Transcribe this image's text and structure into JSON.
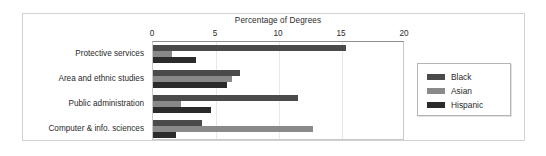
{
  "chart_data": {
    "type": "bar",
    "orientation": "horizontal",
    "title": "Percentage of Degrees",
    "xlabel": "",
    "ylabel": "",
    "xlim": [
      0,
      20
    ],
    "xticks": [
      0,
      5,
      10,
      15,
      20
    ],
    "xtick_labels": [
      "0",
      "5",
      "10",
      "15",
      "20"
    ],
    "grid": true,
    "legend_position": "right",
    "categories": [
      "Protective services",
      "Area and ethnic studies",
      "Public administration",
      "Computer & info. sciences"
    ],
    "series": [
      {
        "name": "Black",
        "color": "#4a4a4a",
        "values": [
          15.3,
          6.9,
          11.5,
          3.9
        ]
      },
      {
        "name": "Asian",
        "color": "#898989",
        "values": [
          1.5,
          6.3,
          2.2,
          12.7
        ]
      },
      {
        "name": "Hispanic",
        "color": "#2b2b2b",
        "values": [
          3.4,
          5.9,
          4.6,
          1.8
        ]
      }
    ]
  },
  "legend": {
    "entries": [
      {
        "label": "Black"
      },
      {
        "label": "Asian"
      },
      {
        "label": "Hispanic"
      }
    ]
  }
}
